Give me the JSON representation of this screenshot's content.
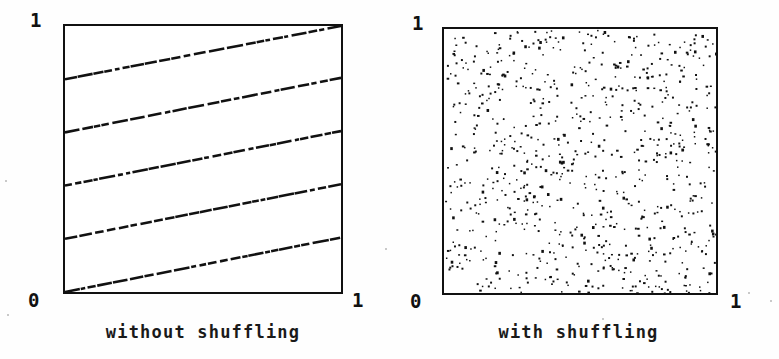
{
  "figure": {
    "background_color": "#ffffff",
    "ink_color": "#111111",
    "panel_count": 2
  },
  "panels": [
    {
      "id": "without-shuffling",
      "caption": "without shuffling",
      "axis": {
        "y_max_label": "1",
        "origin_label": "0",
        "x_max_label": "1"
      }
    },
    {
      "id": "with-shuffling",
      "caption": "with shuffling",
      "axis": {
        "y_max_label": "1",
        "origin_label": "0",
        "x_max_label": "1"
      }
    }
  ],
  "chart_data": [
    {
      "type": "line",
      "title": "without shuffling",
      "xlabel": "",
      "ylabel": "",
      "xlim": [
        0,
        1
      ],
      "ylim": [
        0,
        1
      ],
      "xticks": [
        0,
        1
      ],
      "xticklabels": [
        "0",
        "1"
      ],
      "yticks": [
        0,
        1
      ],
      "yticklabels": [
        "1"
      ],
      "grid": false,
      "legend": false,
      "style": "dashed-stippled",
      "description": "Five parallel ascending dashed line segments spanning the unit square, wrapping from right edge back to left edge; correlated low-discrepancy sample pattern.",
      "series": [
        {
          "name": "band-1",
          "x": [
            0.0,
            1.0
          ],
          "y": [
            0.0,
            0.205
          ]
        },
        {
          "name": "band-2",
          "x": [
            0.0,
            1.0
          ],
          "y": [
            0.2,
            0.405
          ]
        },
        {
          "name": "band-3",
          "x": [
            0.0,
            1.0
          ],
          "y": [
            0.4,
            0.605
          ]
        },
        {
          "name": "band-4",
          "x": [
            0.0,
            1.0
          ],
          "y": [
            0.6,
            0.805
          ]
        },
        {
          "name": "band-5",
          "x": [
            0.0,
            1.0
          ],
          "y": [
            0.8,
            1.0
          ]
        }
      ],
      "n_lines": 5,
      "slope": 0.205
    },
    {
      "type": "scatter",
      "title": "with shuffling",
      "xlabel": "",
      "ylabel": "",
      "xlim": [
        0,
        1
      ],
      "ylim": [
        0,
        1
      ],
      "xticks": [
        0,
        1
      ],
      "xticklabels": [
        "0",
        "1"
      ],
      "yticks": [
        0,
        1
      ],
      "yticklabels": [
        "1"
      ],
      "grid": false,
      "legend": false,
      "marker": "point",
      "marker_size": 2,
      "n_points": 820,
      "description": "Approximately 820 uniformly scattered points filling the unit square; decorrelated (shuffled) sample pattern."
    }
  ]
}
